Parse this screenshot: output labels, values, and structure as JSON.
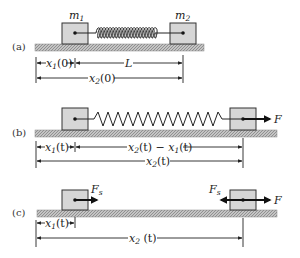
{
  "panels": [
    {
      "id": "a",
      "label": "(a)",
      "mass_left_label": "m",
      "mass_left_sub": "1",
      "mass_right_label": "m",
      "mass_right_sub": "2",
      "dim_top_left": {
        "var": "x",
        "sub": "1",
        "arg": "(0)"
      },
      "dim_top_right": {
        "text": "L"
      },
      "dim_bottom": {
        "var": "x",
        "sub": "2",
        "arg": "(0)"
      }
    },
    {
      "id": "b",
      "label": "(b)",
      "force_label": "F",
      "dim_top_left": {
        "var": "x",
        "sub": "1",
        "arg": "(t)"
      },
      "dim_top_right": {
        "var_a": "x",
        "sub_a": "2",
        "arg_a": "(t) − ",
        "var_b": "x",
        "sub_b": "1",
        "arg_b": "(t)"
      },
      "dim_bottom": {
        "var": "x",
        "sub": "2",
        "arg": "(t)"
      }
    },
    {
      "id": "c",
      "label": "(c)",
      "force_left_label": "F",
      "force_left_sub": "s",
      "force_right_spring_label": "F",
      "force_right_spring_sub": "s",
      "force_label": "F",
      "dim_top_left": {
        "var": "x",
        "sub": "1",
        "arg": "(t)"
      },
      "dim_bottom": {
        "var": "x",
        "sub": "2",
        "arg": " (t)"
      }
    }
  ],
  "icons": {
    "force_arrow": "arrow-right",
    "spring_force_arrow_left": "arrow-left"
  }
}
